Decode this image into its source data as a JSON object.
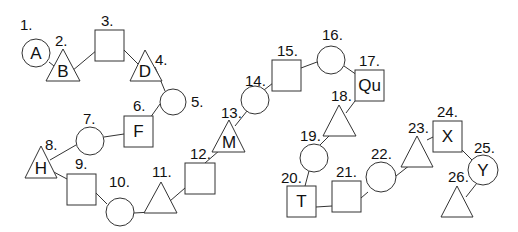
{
  "diagram": {
    "nodes": [
      {
        "id": 1,
        "label": "1.",
        "shape": "circle",
        "letter": "A",
        "cx": 36,
        "cy": 53,
        "r": 14,
        "lx": 20,
        "ly": 30
      },
      {
        "id": 2,
        "label": "2.",
        "shape": "triangle",
        "letter": "B",
        "ax": 63,
        "ay": 49,
        "bx1": 46,
        "bx2": 80,
        "by": 81,
        "lx": 55,
        "ly": 46
      },
      {
        "id": 3,
        "label": "3.",
        "shape": "square",
        "letter": "",
        "x": 95,
        "y": 30,
        "w": 29,
        "h": 31,
        "lx": 101,
        "ly": 26
      },
      {
        "id": 4,
        "label": "4.",
        "shape": "triangle",
        "letter": "D",
        "ax": 145,
        "ay": 50,
        "bx1": 130,
        "bx2": 162,
        "by": 81,
        "lx": 155,
        "ly": 65
      },
      {
        "id": 5,
        "label": "5.",
        "shape": "circle",
        "letter": "",
        "cx": 173,
        "cy": 102,
        "r": 13,
        "lx": 191,
        "ly": 107
      },
      {
        "id": 6,
        "label": "6.",
        "shape": "square",
        "letter": "F",
        "x": 124,
        "y": 116,
        "w": 29,
        "h": 31,
        "lx": 133,
        "ly": 111
      },
      {
        "id": 7,
        "label": "7.",
        "shape": "circle",
        "letter": "",
        "cx": 90,
        "cy": 141,
        "r": 14,
        "lx": 83,
        "ly": 124
      },
      {
        "id": 8,
        "label": "8.",
        "shape": "triangle",
        "letter": "H",
        "ax": 41,
        "ay": 146,
        "bx1": 25,
        "bx2": 57,
        "by": 178,
        "lx": 45,
        "ly": 150
      },
      {
        "id": 9,
        "label": "9.",
        "shape": "square",
        "letter": "",
        "x": 67,
        "y": 174,
        "w": 29,
        "h": 31,
        "lx": 75,
        "ly": 169
      },
      {
        "id": 10,
        "label": "10.",
        "shape": "circle",
        "letter": "",
        "cx": 120,
        "cy": 212,
        "r": 14,
        "lx": 109,
        "ly": 187
      },
      {
        "id": 11,
        "label": "11.",
        "shape": "triangle",
        "letter": "",
        "ax": 161,
        "ay": 182,
        "bx1": 144,
        "bx2": 177,
        "by": 213,
        "lx": 152,
        "ly": 177
      },
      {
        "id": 12,
        "label": "12.",
        "shape": "square",
        "letter": "",
        "x": 185,
        "y": 163,
        "w": 30,
        "h": 31,
        "lx": 190,
        "ly": 159
      },
      {
        "id": 13,
        "label": "13.",
        "shape": "triangle",
        "letter": "M",
        "ax": 229,
        "ay": 120,
        "bx1": 212,
        "bx2": 245,
        "by": 152,
        "lx": 221,
        "ly": 118
      },
      {
        "id": 14,
        "label": "14.",
        "shape": "circle",
        "letter": "",
        "cx": 255,
        "cy": 100,
        "r": 14,
        "lx": 245,
        "ly": 86
      },
      {
        "id": 15,
        "label": "15.",
        "shape": "square",
        "letter": "",
        "x": 272,
        "y": 60,
        "w": 29,
        "h": 31,
        "lx": 277,
        "ly": 56
      },
      {
        "id": 16,
        "label": "16.",
        "shape": "circle",
        "letter": "",
        "cx": 331,
        "cy": 60,
        "r": 14,
        "lx": 322,
        "ly": 40
      },
      {
        "id": 17,
        "label": "17.",
        "shape": "square",
        "letter": "Qu",
        "x": 355,
        "y": 70,
        "w": 29,
        "h": 31,
        "lx": 359,
        "ly": 66
      },
      {
        "id": 18,
        "label": "18.",
        "shape": "triangle",
        "letter": "",
        "ax": 339,
        "ay": 105,
        "bx1": 323,
        "bx2": 356,
        "by": 136,
        "lx": 331,
        "ly": 101
      },
      {
        "id": 19,
        "label": "19.",
        "shape": "circle",
        "letter": "",
        "cx": 314,
        "cy": 158,
        "r": 14,
        "lx": 300,
        "ly": 141
      },
      {
        "id": 20,
        "label": "20.",
        "shape": "square",
        "letter": "T",
        "x": 287,
        "y": 186,
        "w": 29,
        "h": 31,
        "lx": 281,
        "ly": 183
      },
      {
        "id": 21,
        "label": "21.",
        "shape": "square",
        "letter": "",
        "x": 332,
        "y": 181,
        "w": 29,
        "h": 31,
        "lx": 336,
        "ly": 177
      },
      {
        "id": 22,
        "label": "22.",
        "shape": "circle",
        "letter": "",
        "cx": 381,
        "cy": 177,
        "r": 15,
        "lx": 371,
        "ly": 159
      },
      {
        "id": 23,
        "label": "23.",
        "shape": "triangle",
        "letter": "",
        "ax": 417,
        "ay": 136,
        "bx1": 401,
        "bx2": 433,
        "by": 167,
        "lx": 408,
        "ly": 133
      },
      {
        "id": 24,
        "label": "24.",
        "shape": "square",
        "letter": "X",
        "x": 433,
        "y": 121,
        "w": 29,
        "h": 31,
        "lx": 437,
        "ly": 117
      },
      {
        "id": 25,
        "label": "25.",
        "shape": "circle",
        "letter": "Y",
        "cx": 483,
        "cy": 170,
        "r": 15,
        "lx": 474,
        "ly": 153
      },
      {
        "id": 26,
        "label": "26.",
        "shape": "triangle",
        "letter": "",
        "ax": 457,
        "ay": 186,
        "bx1": 441,
        "bx2": 473,
        "by": 217,
        "lx": 448,
        "ly": 182
      }
    ],
    "edges": [
      [
        49,
        62,
        54,
        66
      ],
      [
        72,
        71,
        97,
        50
      ],
      [
        124,
        50,
        138,
        64
      ],
      [
        155,
        67,
        165,
        91
      ],
      [
        160,
        104,
        150,
        118
      ],
      [
        124,
        134,
        104,
        137
      ],
      [
        76,
        145,
        50,
        160
      ],
      [
        50,
        170,
        67,
        179
      ],
      [
        96,
        193,
        107,
        204
      ],
      [
        134,
        213,
        152,
        212
      ],
      [
        170,
        201,
        185,
        188
      ],
      [
        205,
        163,
        220,
        150
      ],
      [
        235,
        126,
        247,
        111
      ],
      [
        264,
        90,
        273,
        83
      ],
      [
        301,
        68,
        317,
        62
      ],
      [
        344,
        66,
        357,
        75
      ],
      [
        355,
        101,
        346,
        113
      ],
      [
        330,
        135,
        320,
        145
      ],
      [
        309,
        171,
        305,
        186
      ],
      [
        316,
        207,
        332,
        206
      ],
      [
        361,
        198,
        368,
        192
      ],
      [
        396,
        176,
        410,
        165
      ],
      [
        427,
        140,
        433,
        137
      ],
      [
        460,
        148,
        474,
        162
      ],
      [
        477,
        183,
        466,
        197
      ]
    ]
  }
}
